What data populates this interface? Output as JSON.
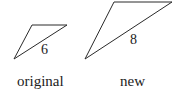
{
  "figure": {
    "original": {
      "caption": "original",
      "side_label": "6",
      "points": "14,59 32,25 67,25"
    },
    "new": {
      "caption": "new",
      "side_label": "8",
      "points": "85,59 114,2 172,2"
    },
    "stroke_color": "#2a2a2a"
  }
}
